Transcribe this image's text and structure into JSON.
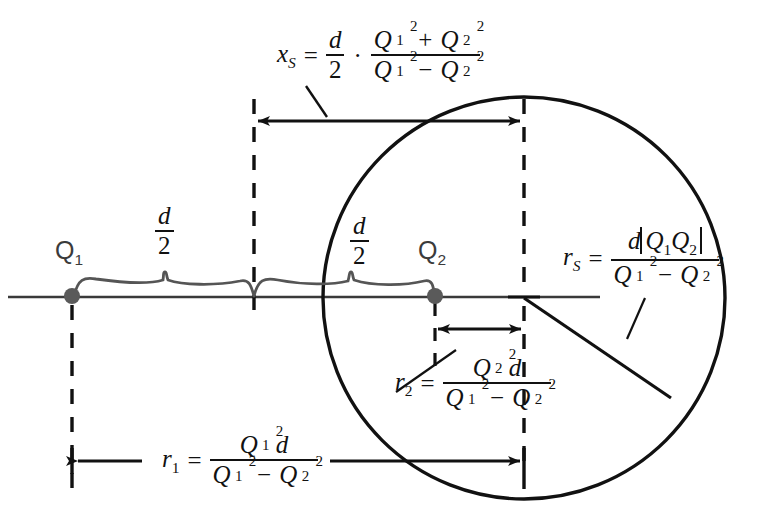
{
  "diagram": {
    "colors": {
      "stroke": "#111111",
      "charge": "#555555",
      "axis": "#3a3a3a",
      "background": "#ffffff"
    },
    "geometry": {
      "axis_y": 297,
      "circle_center_x": 524,
      "circle_center_y": 298,
      "circle_radius": 201,
      "charge1_x": 72,
      "charge2_x": 435,
      "midpoint_x": 254,
      "xs_arrow_y": 121,
      "r2_arrow_y": 329,
      "r1_arrow_y": 461,
      "radius_end_x": 671,
      "radius_end_y": 398
    },
    "charges": [
      {
        "name": "charge-1",
        "label": "Q",
        "index": "1",
        "x": 72
      },
      {
        "name": "charge-2",
        "label": "Q",
        "index": "2",
        "x": 435
      }
    ],
    "braces": [
      {
        "name": "brace-left",
        "label_num": "d",
        "label_den": "2",
        "from_x": 72,
        "to_x": 254
      },
      {
        "name": "brace-right",
        "label_num": "d",
        "label_den": "2",
        "from_x": 254,
        "to_x": 435
      }
    ],
    "formulas": {
      "xs": {
        "lhs_var": "x",
        "lhs_sub": "S",
        "equals": "=",
        "factor_num": "d",
        "factor_den": "2",
        "dot": "·",
        "num_left": "Q",
        "num_left_sup": "2",
        "num_left_sub": "1",
        "num_op": "+",
        "num_right": "Q",
        "num_right_sup": "2",
        "num_right_sub": "2",
        "den_left": "Q",
        "den_left_sup": "2",
        "den_left_sub": "1",
        "den_op": "−",
        "den_right": "Q",
        "den_right_sup": "2",
        "den_right_sub": "2"
      },
      "rs": {
        "lhs_var": "r",
        "lhs_sub": "S",
        "equals": "=",
        "num_d": "d",
        "num_q1": "Q",
        "num_q1_sub": "1",
        "num_q2": "Q",
        "num_q2_sub": "2",
        "den_left": "Q",
        "den_left_sup": "2",
        "den_left_sub": "1",
        "den_op": "−",
        "den_right": "Q",
        "den_right_sup": "2",
        "den_right_sub": "2"
      },
      "r2": {
        "lhs_var": "r",
        "lhs_sub": "2",
        "equals": "=",
        "num_q": "Q",
        "num_q_sup": "2",
        "num_q_sub": "2",
        "num_d": "d",
        "den_left": "Q",
        "den_left_sup": "2",
        "den_left_sub": "1",
        "den_op": "−",
        "den_right": "Q",
        "den_right_sup": "2",
        "den_right_sub": "2"
      },
      "r1": {
        "lhs_var": "r",
        "lhs_sub": "1",
        "equals": "=",
        "num_q": "Q",
        "num_q_sup": "2",
        "num_q_sub": "1",
        "num_d": "d",
        "den_left": "Q",
        "den_left_sup": "2",
        "den_left_sub": "1",
        "den_op": "−",
        "den_right": "Q",
        "den_right_sup": "2",
        "den_right_sub": "2"
      }
    }
  }
}
